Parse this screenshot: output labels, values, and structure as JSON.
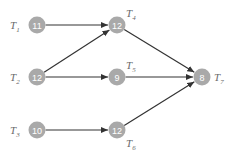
{
  "diagram": {
    "type": "task-dependency-graph",
    "colors": {
      "node": "#a9a9a9",
      "node_text": "#ffffff",
      "label": "#6a6a6a",
      "edge": "#333333"
    },
    "nodes": [
      {
        "id": "T1",
        "letter": "T",
        "sub": "1",
        "value": "11",
        "x": 37,
        "y": 25,
        "label_pos": "left"
      },
      {
        "id": "T4",
        "letter": "T",
        "sub": "4",
        "value": "12",
        "x": 117,
        "y": 25,
        "label_pos": "top-right"
      },
      {
        "id": "T2",
        "letter": "T",
        "sub": "2",
        "value": "12",
        "x": 37,
        "y": 77,
        "label_pos": "left"
      },
      {
        "id": "T5",
        "letter": "T",
        "sub": "5",
        "value": "9",
        "x": 117,
        "y": 77,
        "label_pos": "top-right"
      },
      {
        "id": "T7",
        "letter": "T",
        "sub": "7",
        "value": "8",
        "x": 202,
        "y": 77,
        "label_pos": "right"
      },
      {
        "id": "T3",
        "letter": "T",
        "sub": "3",
        "value": "10",
        "x": 37,
        "y": 130,
        "label_pos": "left"
      },
      {
        "id": "T6",
        "letter": "T",
        "sub": "6",
        "value": "12",
        "x": 117,
        "y": 130,
        "label_pos": "bottom-right"
      }
    ],
    "edges": [
      {
        "from": "T1",
        "to": "T4"
      },
      {
        "from": "T2",
        "to": "T4"
      },
      {
        "from": "T2",
        "to": "T5"
      },
      {
        "from": "T4",
        "to": "T7"
      },
      {
        "from": "T5",
        "to": "T7"
      },
      {
        "from": "T3",
        "to": "T6"
      },
      {
        "from": "T6",
        "to": "T7"
      }
    ]
  }
}
